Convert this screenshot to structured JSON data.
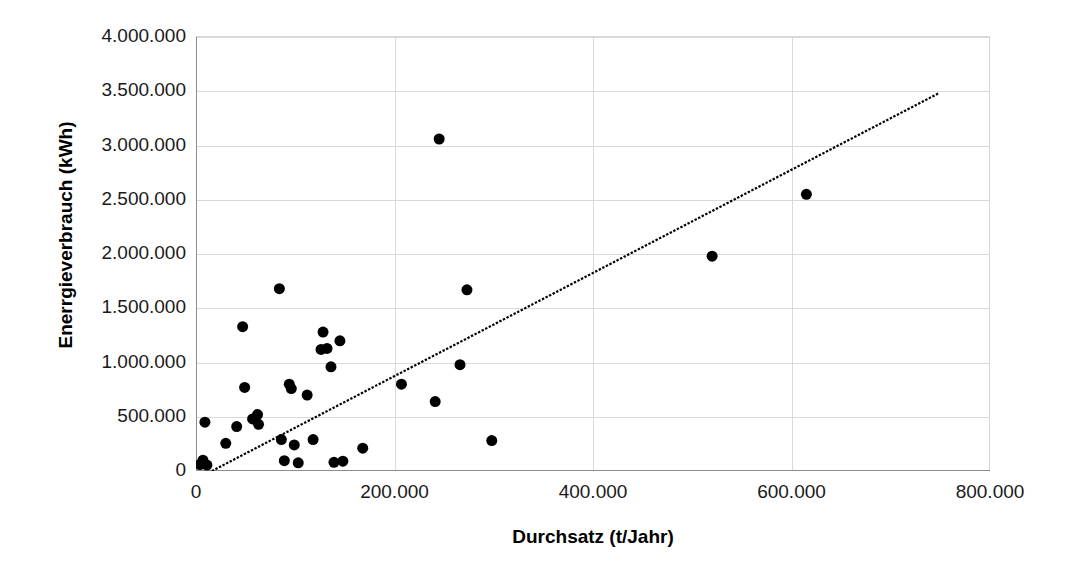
{
  "chart_data": {
    "type": "scatter",
    "title": "",
    "xlabel": "Durchsatz (t/Jahr)",
    "ylabel": "Enerrgieverbrauch (kWh)",
    "xlim": [
      0,
      800000
    ],
    "ylim": [
      0,
      4000000
    ],
    "xticks": [
      0,
      200000,
      400000,
      600000,
      800000
    ],
    "xtick_labels": [
      "0",
      "200.000",
      "400.000",
      "600.000",
      "800.000"
    ],
    "yticks": [
      0,
      500000,
      1000000,
      1500000,
      2000000,
      2500000,
      3000000,
      3500000,
      4000000
    ],
    "ytick_labels": [
      "0",
      "500.000",
      "1.000.000",
      "1.500.000",
      "2.000.000",
      "2.500.000",
      "3.000.000",
      "3.500.000",
      "4.000.000"
    ],
    "grid": "horizontal-and-vertical",
    "legend": "none",
    "marker_color": "#000000",
    "marker_size": 11,
    "gridline_color": "#d9d9d9",
    "axis_color": "#8c8c8c",
    "points": [
      [
        4000,
        60000
      ],
      [
        7000,
        100000
      ],
      [
        9000,
        450000
      ],
      [
        11000,
        55000
      ],
      [
        30000,
        255000
      ],
      [
        41000,
        410000
      ],
      [
        47000,
        1330000
      ],
      [
        49000,
        770000
      ],
      [
        57000,
        480000
      ],
      [
        62000,
        520000
      ],
      [
        63000,
        430000
      ],
      [
        84000,
        1680000
      ],
      [
        86000,
        290000
      ],
      [
        89000,
        95000
      ],
      [
        94000,
        800000
      ],
      [
        96000,
        760000
      ],
      [
        99000,
        240000
      ],
      [
        103000,
        75000
      ],
      [
        112000,
        700000
      ],
      [
        118000,
        290000
      ],
      [
        126000,
        1120000
      ],
      [
        128000,
        1280000
      ],
      [
        132000,
        1130000
      ],
      [
        136000,
        960000
      ],
      [
        139000,
        80000
      ],
      [
        145000,
        1200000
      ],
      [
        148000,
        90000
      ],
      [
        168000,
        210000
      ],
      [
        207000,
        800000
      ],
      [
        245000,
        3060000
      ],
      [
        241000,
        640000
      ],
      [
        266000,
        980000
      ],
      [
        273000,
        1670000
      ],
      [
        298000,
        280000
      ],
      [
        520000,
        1980000
      ],
      [
        615000,
        2550000
      ]
    ],
    "trendline": {
      "type": "linear-dashed",
      "x_start": 16000,
      "y_start": 0,
      "x_end": 748000,
      "y_end": 3480000
    }
  }
}
